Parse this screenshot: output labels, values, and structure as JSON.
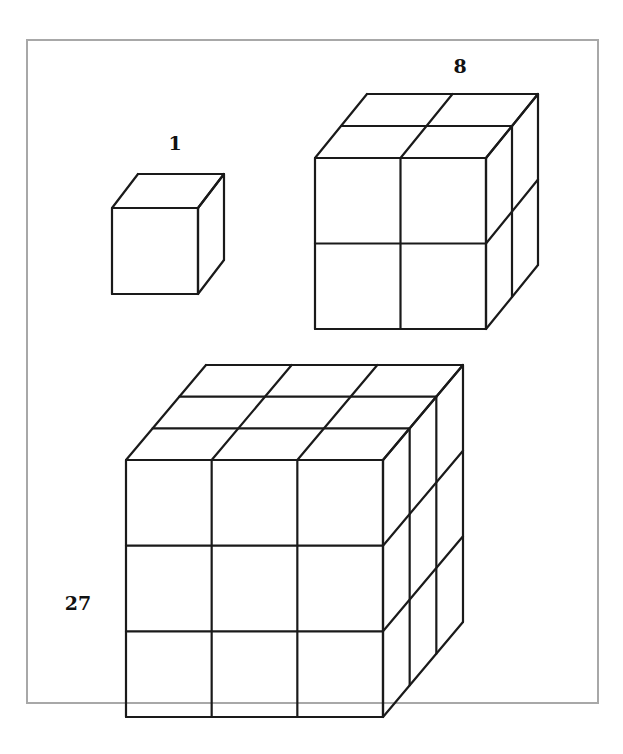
{
  "figure": {
    "colors": {
      "background": "#ffffff",
      "frame": "#a8a8a8",
      "lines": "#1a1a1a"
    },
    "cubes": [
      {
        "id": "cube-1",
        "label": "1",
        "n": 1,
        "label_pos": [
          175,
          150
        ]
      },
      {
        "id": "cube-8",
        "label": "8",
        "n": 2,
        "label_pos": [
          460,
          73
        ]
      },
      {
        "id": "cube-27",
        "label": "27",
        "n": 3,
        "label_pos": [
          78,
          595
        ]
      }
    ]
  }
}
